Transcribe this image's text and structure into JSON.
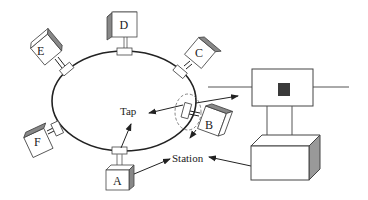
{
  "diagram": {
    "type": "token ring network",
    "stations": [
      {
        "id": "A",
        "label": "A"
      },
      {
        "id": "B",
        "label": "B"
      },
      {
        "id": "C",
        "label": "C"
      },
      {
        "id": "D",
        "label": "D"
      },
      {
        "id": "E",
        "label": "E"
      },
      {
        "id": "F",
        "label": "F"
      }
    ],
    "labels": {
      "tap": "Tap",
      "station": "Station"
    },
    "colors": {
      "line": "#222222",
      "shade": "#9a9a9a",
      "tap_core": "#3a3a3a",
      "background": "#ffffff"
    }
  }
}
